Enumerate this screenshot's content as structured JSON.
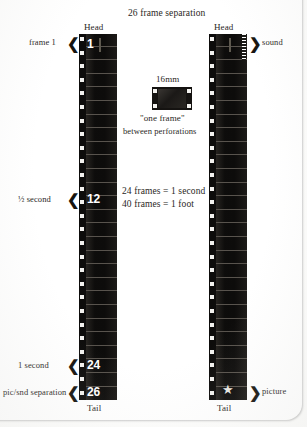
{
  "diagram": {
    "title": "26 frame separation",
    "center_note": {
      "format_label": "16mm",
      "quote": "\"one frame\"",
      "sub": "between perforations"
    },
    "equations": [
      "24 frames =  1 second",
      "40 frames =  1 foot"
    ],
    "picture_strip": {
      "head_label": "Head",
      "tail_label": "Tail",
      "frame_numbers": [
        "1",
        "12",
        "24",
        "26"
      ],
      "callouts": [
        {
          "text": "frame 1",
          "marker": "chevron-left"
        },
        {
          "text": "½ second",
          "marker": "chevron-left"
        },
        {
          "text": "1 second",
          "marker": "chevron-left"
        },
        {
          "text": "pic/snd separation",
          "marker": "chevron-left"
        }
      ]
    },
    "sound_strip": {
      "head_label": "Head",
      "tail_label": "Tail",
      "callouts": [
        {
          "text": "sound",
          "marker": "chevron-right"
        },
        {
          "text": "picture",
          "marker": "chevron-right"
        }
      ]
    },
    "colors": {
      "film_black": "#0d0c0b",
      "perforation": "#f2f1ee",
      "ink": "#2a2724",
      "paper": "#fdfdfc"
    }
  }
}
